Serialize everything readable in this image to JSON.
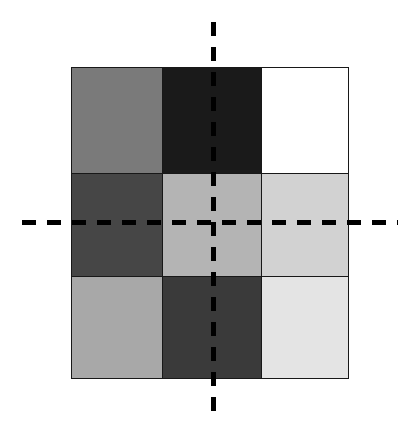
{
  "figure": {
    "background_color": "#ffffff",
    "canvas_width": 418,
    "canvas_height": 432
  },
  "chart_data": {
    "type": "heatmap",
    "title": "",
    "subtitle": "",
    "xlabel": "",
    "ylabel": "",
    "grid": true,
    "legend": "none",
    "columns": [
      "col 1",
      "col 2",
      "col 3"
    ],
    "rows": [
      "row 1",
      "row 2",
      "row 3"
    ],
    "colormap": "grayscale",
    "value_range": [
      0,
      255
    ],
    "cells": [
      [
        {
          "row": 1,
          "col": 1,
          "color": "#7a7a7a",
          "value": 122,
          "name": "cell-r1c1"
        },
        {
          "row": 1,
          "col": 2,
          "color": "#1a1a1a",
          "value": 26,
          "name": "cell-r1c2"
        },
        {
          "row": 1,
          "col": 3,
          "color": "#ffffff",
          "value": 255,
          "name": "cell-r1c3"
        }
      ],
      [
        {
          "row": 2,
          "col": 1,
          "color": "#464646",
          "value": 70,
          "name": "cell-r2c1"
        },
        {
          "row": 2,
          "col": 2,
          "color": "#b4b4b4",
          "value": 180,
          "name": "cell-r2c2"
        },
        {
          "row": 2,
          "col": 3,
          "color": "#d2d2d2",
          "value": 210,
          "name": "cell-r2c3"
        }
      ],
      [
        {
          "row": 3,
          "col": 1,
          "color": "#a8a8a8",
          "value": 168,
          "name": "cell-r3c1"
        },
        {
          "row": 3,
          "col": 2,
          "color": "#3a3a3a",
          "value": 58,
          "name": "cell-r3c2"
        },
        {
          "row": 3,
          "col": 3,
          "color": "#e4e4e4",
          "value": 228,
          "name": "cell-r3c3"
        }
      ]
    ],
    "values": [
      [
        122,
        26,
        255
      ],
      [
        70,
        180,
        210
      ],
      [
        168,
        58,
        228
      ]
    ],
    "cell_border_color": "#181818",
    "annotations": [
      {
        "name": "vertical-axis-line",
        "orientation": "vertical",
        "style": "dashed",
        "color": "#000000",
        "position_x": 214,
        "extent": [
          22,
          418
        ]
      },
      {
        "name": "horizontal-axis-line",
        "orientation": "horizontal",
        "style": "dashed",
        "color": "#000000",
        "position_y": 223,
        "extent": [
          22,
          398
        ]
      }
    ]
  }
}
